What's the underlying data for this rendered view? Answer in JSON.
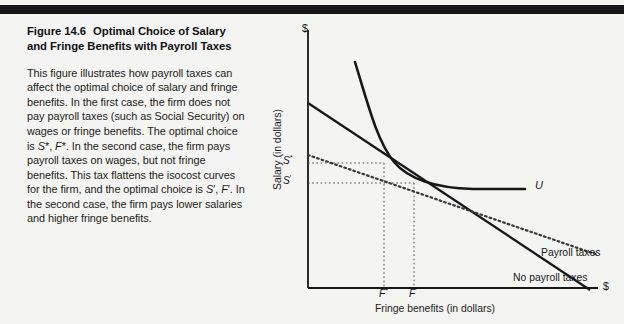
{
  "figure": {
    "number": "Figure 14.6",
    "title": "Optimal Choice of Salary and Fringe Benefits with Payroll Taxes",
    "body": "This figure illustrates how payroll taxes can affect the optimal choice of salary and fringe benefits. In the first case, the firm does not pay payroll taxes (such as Social Security) on wages or fringe benefits. The optimal choice is S*, F*. In the second case, the firm pays payroll taxes on wages, but not fringe benefits. This tax flattens the isocost curves for the firm, and the optimal choice is S', F'. In the second case, the firm pays lower salaries and higher fringe benefits."
  },
  "chart_data": {
    "type": "line",
    "title": "Optimal Choice of Salary and Fringe Benefits with Payroll Taxes",
    "xlabel": "Fringe benefits (in dollars)",
    "ylabel": "Salary (in dollars)",
    "x_axis_end_marker": "$",
    "y_axis_end_marker": "$",
    "xlim": [
      0,
      1
    ],
    "ylim": [
      0,
      1
    ],
    "grid": false,
    "legend_position": "inline-right",
    "tick_labels": {
      "y": [
        {
          "label": "S",
          "sup": "*",
          "value": 0.484
        },
        {
          "label": "S",
          "sup": "'",
          "value": 0.407
        }
      ],
      "x": [
        {
          "label": "F",
          "sup": "*",
          "value": 0.262
        },
        {
          "label": "F",
          "sup": "'",
          "value": 0.366
        }
      ]
    },
    "series": [
      {
        "name": "No payroll taxes",
        "style": "solid",
        "description": "Steep isocost line, firm pays no payroll taxes",
        "points": [
          [
            0.0,
            0.717
          ],
          [
            1.0,
            0.0
          ]
        ]
      },
      {
        "name": "Payroll taxes",
        "style": "dotted",
        "description": "Flatter isocost line, firm pays payroll taxes on wages only",
        "points": [
          [
            0.0,
            0.517
          ],
          [
            1.0,
            0.128
          ]
        ]
      },
      {
        "name": "U",
        "style": "solid-curve",
        "description": "Convex indifference curve of the worker",
        "points": [
          [
            0.162,
            0.876
          ],
          [
            0.2,
            0.7
          ],
          [
            0.24,
            0.56
          ],
          [
            0.262,
            0.484
          ],
          [
            0.3,
            0.44
          ],
          [
            0.366,
            0.407
          ],
          [
            0.45,
            0.392
          ],
          [
            0.56,
            0.39
          ],
          [
            0.75,
            0.39
          ]
        ]
      }
    ],
    "annotations": [
      {
        "text": "U",
        "series": "U"
      },
      {
        "text": "Payroll taxes",
        "series": "Payroll taxes"
      },
      {
        "text": "No payroll taxes",
        "series": "No payroll taxes"
      }
    ],
    "optimal_points": [
      {
        "name": "No-tax optimum",
        "x_label": "F*",
        "y_label": "S*",
        "x": 0.262,
        "y": 0.484
      },
      {
        "name": "Tax optimum",
        "x_label": "F'",
        "y_label": "S'",
        "x": 0.366,
        "y": 0.407
      }
    ]
  }
}
